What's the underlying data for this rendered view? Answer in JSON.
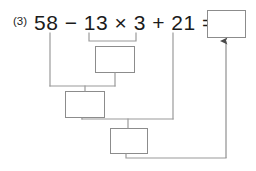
{
  "page": {
    "width": 256,
    "height": 171,
    "background": "#ffffff",
    "line_color": "#8c8c8c",
    "text_color": "#1b1b1b"
  },
  "problem": {
    "number_label": "(3)",
    "expression": "58 − 13 × 3 + 21 =",
    "operands": [
      "58",
      "13",
      "3",
      "21"
    ],
    "operators": [
      "−",
      "×",
      "+"
    ],
    "equals_sign": "="
  },
  "answer_box": {
    "name": "final-answer-box",
    "value": "",
    "placeholder": "",
    "x": 207,
    "y": 10,
    "width": 39,
    "height": 28
  },
  "work_boxes": [
    {
      "name": "step-1-box",
      "step": 1,
      "describes": "13 × 3",
      "value": "",
      "x": 95,
      "y": 46,
      "width": 40,
      "height": 27
    },
    {
      "name": "step-2-box",
      "step": 2,
      "describes": "58 − (13 × 3)",
      "value": "",
      "x": 65,
      "y": 91,
      "width": 40,
      "height": 27
    },
    {
      "name": "step-3-box",
      "step": 3,
      "describes": "(58 − 39) + 21",
      "value": "",
      "x": 110,
      "y": 128,
      "width": 38,
      "height": 26
    }
  ],
  "connectors": {
    "bracket_1": {
      "y": 41,
      "x_start": 89,
      "x_end": 136
    },
    "bracket_2": {
      "y": 86,
      "x_start": 50,
      "x_end": 115
    },
    "bracket_3": {
      "y": 119,
      "x_start": 82,
      "x_end": 173
    },
    "final_path": {
      "y": 158,
      "x_start": 126,
      "x_end": 226,
      "arrow_to_y": 40
    }
  }
}
